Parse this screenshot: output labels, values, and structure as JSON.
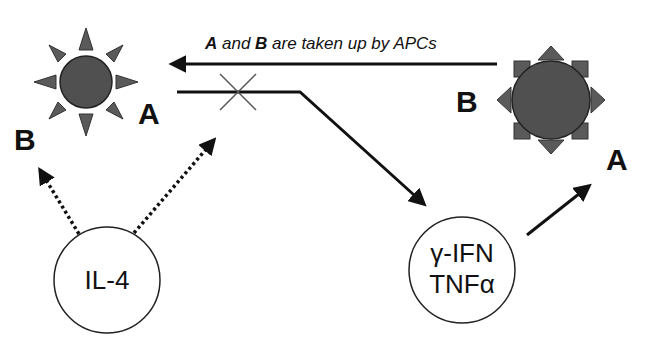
{
  "diagram": {
    "caption": {
      "a": "A",
      "mid1": " and ",
      "b": "B",
      "rest": " are taken up by APCs"
    },
    "left_cell": {
      "label_a": "A",
      "label_b": "B"
    },
    "right_cell": {
      "label_b": "B",
      "label_a": "A"
    },
    "il4_circle": {
      "label": "IL-4"
    },
    "ifn_circle": {
      "line1": "γ-IFN",
      "line2": "TNFα"
    },
    "colors": {
      "cell_fill": "#505050",
      "spike_fill": "#5a5a5a",
      "line": "#111111",
      "blocked_mark": "#555555"
    }
  }
}
